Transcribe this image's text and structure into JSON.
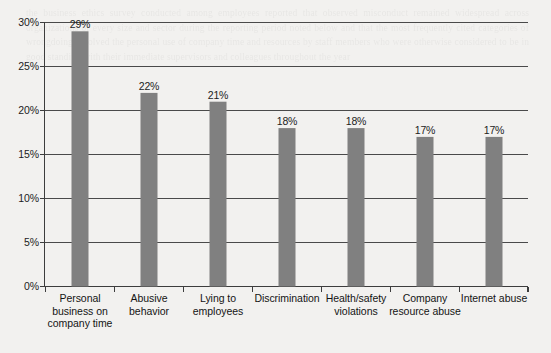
{
  "chart_data": {
    "type": "bar",
    "title": "",
    "subtitle": "",
    "xlabel": "",
    "ylabel": "",
    "categories": [
      "Personal business on company time",
      "Abusive behavior",
      "Lying to employees",
      "Discrimination",
      "Health/safety violations",
      "Company resource abuse",
      "Internet abuse"
    ],
    "category_lines": [
      [
        "Personal",
        "business on",
        "company time"
      ],
      [
        "Abusive",
        "behavior"
      ],
      [
        "Lying to",
        "employees"
      ],
      [
        "Discrimination"
      ],
      [
        "Health/safety",
        "violations"
      ],
      [
        "Company",
        "resource abuse"
      ],
      [
        "Internet abuse"
      ]
    ],
    "values": [
      29,
      22,
      21,
      18,
      18,
      17,
      17
    ],
    "value_labels": [
      "29%",
      "22%",
      "21%",
      "18%",
      "18%",
      "17%",
      "17%"
    ],
    "ylim": [
      0,
      30
    ],
    "ytick_values": [
      0,
      5,
      10,
      15,
      20,
      25,
      30
    ],
    "ytick_labels": [
      "0%",
      "5%",
      "10%",
      "15%",
      "20%",
      "25%",
      "30%"
    ],
    "grid": true,
    "grid_axis": "y",
    "legend": false,
    "bar_color": "#808080",
    "grid_color": "#4a4a4a",
    "axis_color": "#3d3d3d",
    "text_color": "#1c1c1c",
    "background_color": "#f2f1ef"
  },
  "bleed_text": "the business ethics survey conducted among employees reported that observed misconduct remained widespread across organizations of every size and sector during the reporting period noted below and that the most frequently cited categories of wrongdoing involved the personal use of company time and resources by staff members who were otherwise considered to be in good standing with their immediate supervisors and colleagues throughout the year"
}
